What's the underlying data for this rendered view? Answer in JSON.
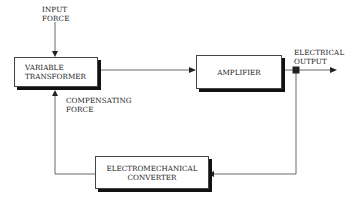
{
  "diagram": {
    "type": "block-diagram",
    "input_label": "INPUT\nFORCE",
    "blocks": [
      {
        "id": "variable-transformer",
        "label": "VARIABLE\nTRANSFORMER"
      },
      {
        "id": "amplifier",
        "label": "AMPLIFIER"
      },
      {
        "id": "electromechanical-converter",
        "label": "ELECTROMECHANICAL\nCONVERTER"
      }
    ],
    "output_label": "ELECTRICAL\nOUTPUT",
    "feedback_label": "COMPENSATING\nFORCE",
    "edges": [
      {
        "from": "input",
        "to": "variable-transformer"
      },
      {
        "from": "variable-transformer",
        "to": "amplifier"
      },
      {
        "from": "amplifier",
        "to": "output"
      },
      {
        "from": "output",
        "to": "electromechanical-converter"
      },
      {
        "from": "electromechanical-converter",
        "to": "variable-transformer",
        "label": "COMPENSATING FORCE"
      }
    ]
  }
}
